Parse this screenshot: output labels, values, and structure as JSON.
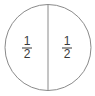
{
  "diagram": {
    "parts": [
      {
        "numerator": "1",
        "denominator": "2"
      },
      {
        "numerator": "1",
        "denominator": "2"
      }
    ],
    "colors": {
      "outline": "#8a8a8a",
      "text": "#3a3a3a",
      "fill": "#ffffff"
    }
  }
}
